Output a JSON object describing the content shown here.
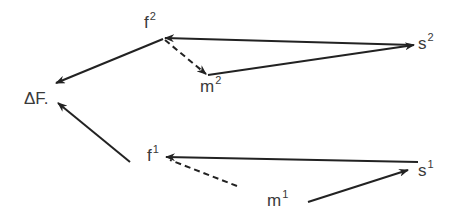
{
  "diagram": {
    "labels": {
      "f2": {
        "base": "f",
        "sup": "2"
      },
      "s2": {
        "base": "s",
        "sup": "2"
      },
      "m2": {
        "base": "m",
        "sup": "2"
      },
      "deltaF": {
        "text": "ΔF."
      },
      "f1": {
        "base": "f",
        "sup": "1"
      },
      "s1": {
        "base": "s",
        "sup": "1"
      },
      "m1": {
        "base": "m",
        "sup": "1"
      }
    },
    "edges": [
      {
        "from": "s2",
        "to": "f2",
        "style": "solid"
      },
      {
        "from": "m2",
        "to": "s2",
        "style": "solid"
      },
      {
        "from": "f2",
        "to": "m2",
        "style": "dashed"
      },
      {
        "from": "f2",
        "to": "deltaF",
        "style": "solid"
      },
      {
        "from": "f1-region",
        "to": "deltaF",
        "style": "solid"
      },
      {
        "from": "s1",
        "to": "f1",
        "style": "solid"
      },
      {
        "from": "m1-region",
        "to": "f1",
        "style": "dashed"
      },
      {
        "from": "m1",
        "to": "s1",
        "style": "solid"
      }
    ],
    "colors": {
      "stroke": "#222222",
      "text": "#3a3a3a"
    }
  }
}
